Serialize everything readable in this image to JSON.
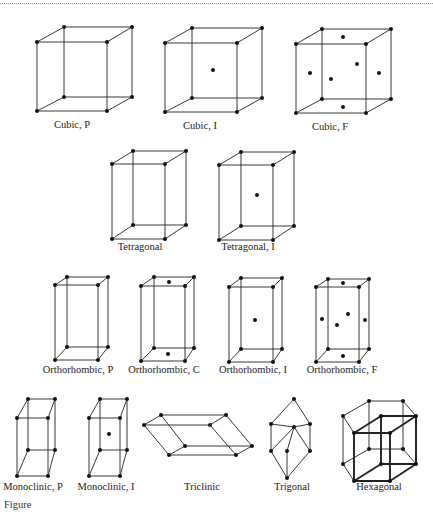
{
  "figure": {
    "caption": "Figure",
    "lattices": [
      {
        "name": "Cubic, P",
        "label_pos": [
          72,
          129
        ],
        "front": [
          [
            37,
            42
          ],
          [
            107,
            42
          ],
          [
            107,
            111
          ],
          [
            37,
            111
          ]
        ],
        "back": [
          [
            64,
            27
          ],
          [
            132,
            27
          ],
          [
            132,
            97
          ],
          [
            64,
            97
          ]
        ],
        "extra_atoms": []
      },
      {
        "name": "Cubic, I",
        "label_pos": [
          200,
          130
        ],
        "front": [
          [
            165,
            43
          ],
          [
            237,
            43
          ],
          [
            237,
            112
          ],
          [
            165,
            112
          ]
        ],
        "back": [
          [
            192,
            28
          ],
          [
            262,
            28
          ],
          [
            262,
            98
          ],
          [
            192,
            98
          ]
        ],
        "extra_atoms": [
          [
            213,
            70
          ]
        ]
      },
      {
        "name": "Cubic, F",
        "label_pos": [
          330,
          131
        ],
        "front": [
          [
            296,
            44
          ],
          [
            366,
            44
          ],
          [
            366,
            113
          ],
          [
            296,
            113
          ]
        ],
        "back": [
          [
            322,
            29
          ],
          [
            391,
            29
          ],
          [
            391,
            99
          ],
          [
            322,
            99
          ]
        ],
        "extra_atoms": [
          [
            343,
            37
          ],
          [
            310,
            73
          ],
          [
            331,
            79
          ],
          [
            357,
            64
          ],
          [
            379,
            73
          ],
          [
            343,
            107
          ]
        ]
      },
      {
        "name": "Tetragonal",
        "label_pos": [
          140,
          250
        ],
        "front": [
          [
            112,
            164
          ],
          [
            165,
            164
          ],
          [
            165,
            239
          ],
          [
            112,
            239
          ]
        ],
        "back": [
          [
            133,
            151
          ],
          [
            186,
            151
          ],
          [
            186,
            225
          ],
          [
            133,
            225
          ]
        ],
        "extra_atoms": []
      },
      {
        "name": "Tetragonal, I",
        "label_pos": [
          248,
          250
        ],
        "front": [
          [
            219,
            165
          ],
          [
            273,
            165
          ],
          [
            273,
            240
          ],
          [
            219,
            240
          ]
        ],
        "back": [
          [
            241,
            152
          ],
          [
            294,
            152
          ],
          [
            294,
            226
          ],
          [
            241,
            226
          ]
        ],
        "extra_atoms": [
          [
            257,
            195
          ]
        ]
      },
      {
        "name": "Orthorhombic, P",
        "label_pos": [
          78,
          373
        ],
        "front": [
          [
            55,
            285
          ],
          [
            98,
            285
          ],
          [
            98,
            360
          ],
          [
            55,
            360
          ]
        ],
        "back": [
          [
            67,
            277
          ],
          [
            108,
            277
          ],
          [
            108,
            347
          ],
          [
            67,
            347
          ]
        ],
        "extra_atoms": []
      },
      {
        "name": "Orthorhombic, C",
        "label_pos": [
          164,
          373
        ],
        "front": [
          [
            141,
            286
          ],
          [
            185,
            286
          ],
          [
            185,
            361
          ],
          [
            141,
            361
          ]
        ],
        "back": [
          [
            154,
            277
          ],
          [
            194,
            277
          ],
          [
            194,
            348
          ],
          [
            154,
            348
          ]
        ],
        "extra_atoms": [
          [
            169,
            282
          ],
          [
            168,
            354
          ]
        ]
      },
      {
        "name": "Orthorhombic, I",
        "label_pos": [
          253,
          373
        ],
        "front": [
          [
            229,
            287
          ],
          [
            273,
            287
          ],
          [
            273,
            362
          ],
          [
            229,
            362
          ]
        ],
        "back": [
          [
            241,
            278
          ],
          [
            282,
            278
          ],
          [
            282,
            349
          ],
          [
            241,
            349
          ]
        ],
        "extra_atoms": [
          [
            255,
            320
          ]
        ]
      },
      {
        "name": "Orthorhombic, F",
        "label_pos": [
          342,
          373
        ],
        "front": [
          [
            316,
            287
          ],
          [
            359,
            287
          ],
          [
            359,
            362
          ],
          [
            316,
            362
          ]
        ],
        "back": [
          [
            328,
            279
          ],
          [
            369,
            279
          ],
          [
            369,
            349
          ],
          [
            328,
            349
          ]
        ],
        "extra_atoms": [
          [
            343,
            283
          ],
          [
            322,
            319
          ],
          [
            337,
            325
          ],
          [
            348,
            314
          ],
          [
            365,
            320
          ],
          [
            343,
            356
          ]
        ]
      },
      {
        "name": "Monoclinic, P",
        "label_pos": [
          31,
          489
        ],
        "front": [
          [
            17,
            418
          ],
          [
            48,
            418
          ],
          [
            48,
            476
          ],
          [
            17,
            476
          ]
        ],
        "back": [
          [
            28,
            399
          ],
          [
            55,
            399
          ],
          [
            55,
            450
          ],
          [
            28,
            450
          ]
        ],
        "extra_atoms": []
      },
      {
        "name": "Monoclinic, I",
        "label_pos": [
          105,
          489
        ],
        "front": [
          [
            89,
            418
          ],
          [
            120,
            418
          ],
          [
            120,
            476
          ],
          [
            89,
            476
          ]
        ],
        "back": [
          [
            100,
            399
          ],
          [
            127,
            399
          ],
          [
            127,
            450
          ],
          [
            100,
            450
          ]
        ],
        "extra_atoms": [
          [
            109,
            434
          ]
        ]
      },
      {
        "name": "Triclinic",
        "label_pos": [
          201,
          489
        ],
        "front": [
          [
            144,
            425
          ],
          [
            210,
            425
          ],
          [
            252,
            446
          ],
          [
            185,
            446
          ]
        ],
        "back": [
          [
            161,
            415
          ],
          [
            226,
            415
          ],
          [
            236,
            455
          ],
          [
            169,
            455
          ]
        ],
        "extra_atoms": []
      },
      {
        "name": "Trigonal",
        "label_pos": [
          294,
          489
        ],
        "front": [
          [
            271,
            424
          ],
          [
            294,
            427
          ],
          [
            294,
            450
          ],
          [
            271,
            451
          ]
        ],
        "back": [
          [
            294,
            399
          ],
          [
            310,
            424
          ],
          [
            310,
            451
          ],
          [
            286,
            447
          ]
        ],
        "extra_atoms": [
          [
            287,
            478
          ]
        ]
      },
      {
        "name": "Hexagonal",
        "label_pos": [
          380,
          489
        ],
        "front": [
          [
            354,
            448
          ],
          [
            390,
            440
          ],
          [
            390,
            481
          ],
          [
            354,
            481
          ]
        ],
        "back": [
          [
            343,
            416
          ],
          [
            369,
            401
          ],
          [
            403,
            401
          ],
          [
            416,
            416
          ]
        ],
        "extra_atoms": []
      }
    ]
  }
}
